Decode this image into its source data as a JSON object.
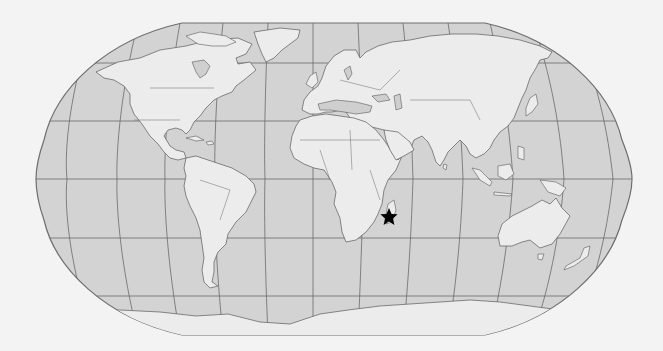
{
  "map": {
    "projection": "robinson",
    "graticule": {
      "meridian_spacing_deg": 30,
      "parallels_deg": [
        60,
        30,
        0,
        -30,
        -60
      ]
    },
    "colors": {
      "background": "#f3f3f3",
      "ocean": "#d3d3d3",
      "land": "#ececec",
      "lines": "#5a5a5a",
      "marker": "#000000"
    },
    "marker": {
      "type": "star",
      "label": "Madagascar",
      "x": 389,
      "y": 217
    }
  }
}
